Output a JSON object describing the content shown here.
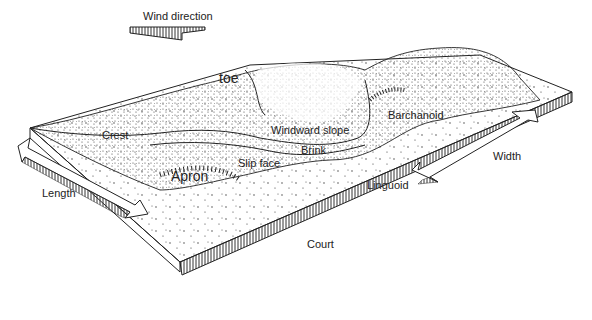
{
  "diagram": {
    "labels": {
      "wind_direction": "Wind direction",
      "toe": "toe",
      "crest": "Crest",
      "windward_slope": "Windward slope",
      "brink": "Brink",
      "slip_face": "Slip face",
      "apron": "Apron",
      "barchanoid": "Barchanoid",
      "linguoid": "Linguoid",
      "width": "Width",
      "length": "Length",
      "court": "Court"
    },
    "colors": {
      "ink": "#222222",
      "background": "#ffffff"
    }
  }
}
